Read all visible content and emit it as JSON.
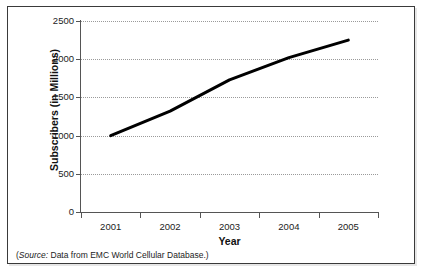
{
  "figure": {
    "background_color": "#ffffff",
    "border_color": "#3a3a3a"
  },
  "source_note": {
    "open_paren": "(",
    "label": "Source:",
    "text": " Data from EMC World Cellular Database.)"
  },
  "chart_data": {
    "type": "line",
    "title": "",
    "xlabel": "Year",
    "ylabel": "Subscribers (in Millions)",
    "categories": [
      "2001",
      "2002",
      "2003",
      "2004",
      "2005"
    ],
    "x": [
      2001,
      2002,
      2003,
      2004,
      2005
    ],
    "series": [
      {
        "name": "Subscribers",
        "values": [
          1000,
          1320,
          1730,
          2020,
          2250
        ],
        "color": "#000000",
        "line_width": 3
      }
    ],
    "ylim": [
      0,
      2500
    ],
    "yticks": [
      0,
      500,
      1000,
      1500,
      2000,
      2500
    ],
    "ytick_labels": [
      "0",
      "500",
      "1000",
      "1500",
      "2000",
      "2500"
    ],
    "xlim": [
      2000.5,
      2005.5
    ],
    "grid": true,
    "grid_style": "dotted",
    "grid_color": "#9a9a9a",
    "grid_axis": "y",
    "legend": false,
    "legend_position": "none"
  }
}
